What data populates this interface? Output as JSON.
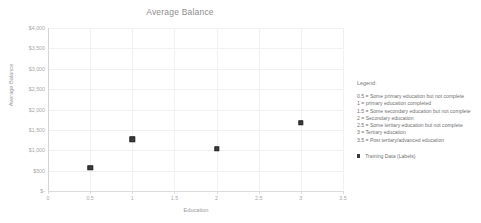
{
  "chart_data": {
    "type": "scatter",
    "title": "Average Balance",
    "xlabel": "Education",
    "ylabel": "Average Balance",
    "xlim": [
      0,
      3.5
    ],
    "ylim": [
      0,
      4000
    ],
    "grid": true,
    "legend_position": "right",
    "x_ticks": [
      "0",
      "0.5",
      "1",
      "1.5",
      "2",
      "2.5",
      "3",
      "3.5"
    ],
    "x_tick_values": [
      0,
      0.5,
      1,
      1.5,
      2,
      2.5,
      3,
      3.5
    ],
    "y_ticks": [
      "$-",
      "$500",
      "$1,000",
      "$1,500",
      "$2,000",
      "$2,500",
      "$3,000",
      "$3,500",
      "$4,000"
    ],
    "y_tick_values": [
      0,
      500,
      1000,
      1500,
      2000,
      2500,
      3000,
      3500,
      4000
    ],
    "series": [
      {
        "name": "Training Data (Labels)",
        "marker": "square",
        "color": "#3b3b3b",
        "x": [
          0.5,
          1,
          2,
          3
        ],
        "y": [
          570,
          1270,
          1030,
          1680
        ],
        "points": [
          {
            "x": 0.5,
            "y": 570
          },
          {
            "x": 1,
            "y": 1270
          },
          {
            "x": 2,
            "y": 1030
          },
          {
            "x": 3,
            "y": 1680
          }
        ]
      }
    ]
  },
  "legend": {
    "title": "Legend:",
    "entries": [
      "0.5 = Some primary education but not complete",
      "1 = primary education completed",
      "1.5 = Some secondary education but not complete",
      "2 = Secondary education",
      "2.5 = Some tertiary education but not complete",
      "3 = Tertiary education",
      "3.5 = Post tertiary/advanced education"
    ],
    "series_label": "Training Data (Labels)"
  }
}
